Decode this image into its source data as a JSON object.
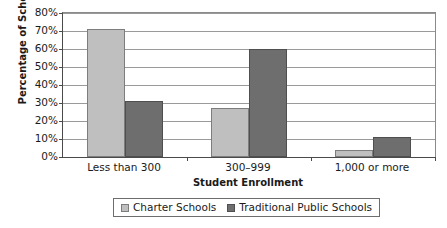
{
  "chart_data": {
    "type": "bar",
    "title": "",
    "xlabel": "Student Enrollment",
    "ylabel": "Percentage of Schools",
    "categories": [
      "Less than 300",
      "300–999",
      "1,000 or more"
    ],
    "series": [
      {
        "name": "Charter Schools",
        "color": "#bfbfbf",
        "values": [
          71,
          27,
          4
        ]
      },
      {
        "name": "Traditional Public Schools",
        "color": "#6e6e6e",
        "values": [
          31,
          60,
          11
        ]
      }
    ],
    "ylim": [
      0,
      80
    ],
    "ytick_step": 10,
    "ytick_labels": [
      "0%",
      "10%",
      "20%",
      "30%",
      "40%",
      "50%",
      "60%",
      "70%",
      "80%"
    ],
    "grid": true,
    "legend_position": "bottom"
  },
  "legend": {
    "items": [
      {
        "label": "Charter Schools",
        "swatch": "light"
      },
      {
        "label": "Traditional Public Schools",
        "swatch": "dark"
      }
    ]
  }
}
